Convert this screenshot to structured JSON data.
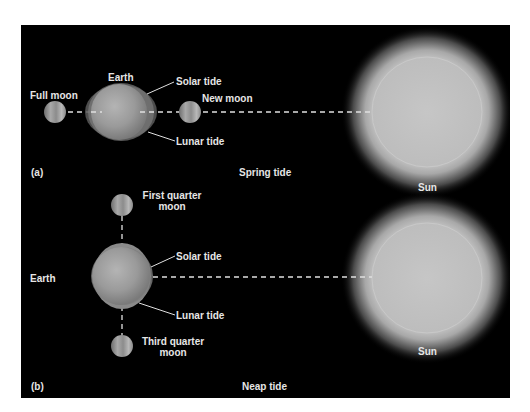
{
  "figure": {
    "background_color": "#000000",
    "label_color": "#e6e6e6",
    "panels": [
      {
        "id": "a",
        "tag": "(a)",
        "caption": "Spring tide",
        "labels": {
          "earth": "Earth",
          "full_moon": "Full moon",
          "new_moon": "New moon",
          "solar_tide": "Solar tide",
          "lunar_tide": "Lunar tide",
          "sun": "Sun"
        }
      },
      {
        "id": "b",
        "tag": "(b)",
        "caption": "Neap tide",
        "labels": {
          "earth": "Earth",
          "first_quarter_moon_line1": "First quarter",
          "first_quarter_moon_line2": "moon",
          "third_quarter_moon_line1": "Third quarter",
          "third_quarter_moon_line2": "moon",
          "solar_tide": "Solar tide",
          "lunar_tide": "Lunar tide",
          "sun": "Sun"
        }
      }
    ]
  }
}
